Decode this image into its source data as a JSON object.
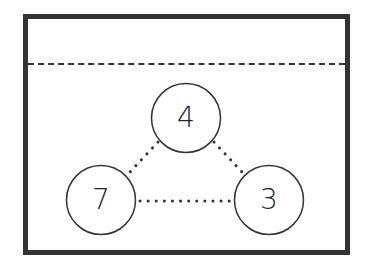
{
  "diagram": {
    "type": "number-bond-triangle",
    "answer_area": "",
    "nodes": [
      {
        "id": "top",
        "label": "4",
        "cx": 186,
        "cy": 118
      },
      {
        "id": "left",
        "label": "7",
        "cx": 101,
        "cy": 200
      },
      {
        "id": "right",
        "label": "3",
        "cx": 269,
        "cy": 200
      }
    ],
    "edges": [
      {
        "from": "top",
        "to": "left",
        "style": "dotted"
      },
      {
        "from": "top",
        "to": "right",
        "style": "dotted"
      },
      {
        "from": "left",
        "to": "right",
        "style": "dotted"
      }
    ],
    "colors": {
      "stroke": "#333333",
      "text": "#222222",
      "background": "#ffffff"
    }
  }
}
